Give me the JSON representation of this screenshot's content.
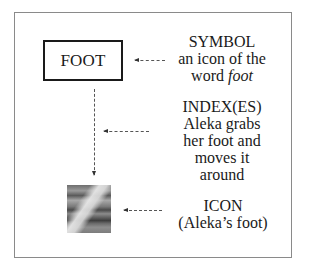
{
  "diagram": {
    "box": {
      "label": "FOOT"
    },
    "symbol": {
      "title": "SYMBOL",
      "line1": "an icon of the",
      "line2_prefix": "word ",
      "line2_italic": "foot"
    },
    "index": {
      "title": "INDEX(ES)",
      "lines": [
        "Aleka grabs",
        "her foot and",
        "moves it",
        "around"
      ]
    },
    "icon": {
      "title": "ICON",
      "caption": "(Aleka’s foot)"
    },
    "image": {
      "description": "grayscale photo of a foot"
    },
    "colors": {
      "border": "#8a8a8a",
      "box_border": "#1a1a1a",
      "text": "#1a1a1a",
      "arrow": "#555555"
    }
  }
}
